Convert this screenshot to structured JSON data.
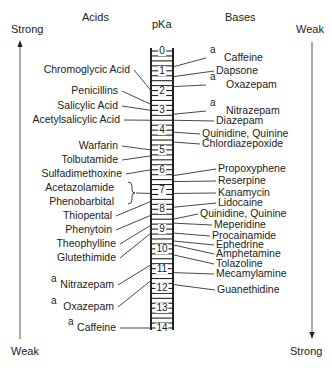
{
  "headers": {
    "acids": "Acids",
    "pka": "pKa",
    "bases": "Bases"
  },
  "left_axis": {
    "top": "Strong",
    "bottom": "Weak"
  },
  "right_axis": {
    "top": "Weak",
    "bottom": "Strong"
  },
  "footnote_marker": "a",
  "scale": {
    "min": 0,
    "max": 14,
    "ticks": [
      "0",
      "1",
      "2",
      "3",
      "4",
      "5",
      "6",
      "7",
      "8",
      "9",
      "10",
      "11",
      "12",
      "13",
      "14"
    ]
  },
  "acids": [
    {
      "name": "Chromoglycic Acid",
      "pka": 2.0
    },
    {
      "name": "Penicillins",
      "pka": 2.7
    },
    {
      "name": "Salicylic Acid",
      "pka": 3.0
    },
    {
      "name": "Acetylsalicylic Acid",
      "pka": 3.5
    },
    {
      "name": "Warfarin",
      "pka": 5.0
    },
    {
      "name": "Tolbutamide",
      "pka": 5.3
    },
    {
      "name": "Sulfadimethoxine",
      "pka": 6.0
    },
    {
      "name": "Acetazolamide",
      "pka": 7.2
    },
    {
      "name": "Phenobarbital",
      "pka": 7.2
    },
    {
      "name": "Thiopental",
      "pka": 7.6
    },
    {
      "name": "Phenytoin",
      "pka": 8.3
    },
    {
      "name": "Theophylline",
      "pka": 8.8
    },
    {
      "name": "Glutethimide",
      "pka": 9.2
    },
    {
      "name": "Nitrazepam",
      "pka": 10.8,
      "footnote": "a"
    },
    {
      "name": "Oxazepam",
      "pka": 11.6,
      "footnote": "a"
    },
    {
      "name": "Caffeine",
      "pka": 14.0,
      "footnote": "a"
    }
  ],
  "bases": [
    {
      "name": "Caffeine",
      "pka": 0.8,
      "footnote": "a"
    },
    {
      "name": "Dapsone",
      "pka": 1.3
    },
    {
      "name": "Oxazepam",
      "pka": 1.8,
      "footnote": "a"
    },
    {
      "name": "Nitrazepam",
      "pka": 3.2,
      "footnote": "a"
    },
    {
      "name": "Diazepam",
      "pka": 3.5
    },
    {
      "name": "Quinidine, Quinine",
      "pka": 4.1
    },
    {
      "name": "Chlordiazepoxide",
      "pka": 4.6
    },
    {
      "name": "Propoxyphene",
      "pka": 6.3
    },
    {
      "name": "Reserpine",
      "pka": 6.6
    },
    {
      "name": "Kanamycin",
      "pka": 7.2
    },
    {
      "name": "Lidocaine",
      "pka": 7.9
    },
    {
      "name": "Quinidine, Quinine",
      "pka": 8.5
    },
    {
      "name": "Meperidine",
      "pka": 8.7
    },
    {
      "name": "Procainamide",
      "pka": 9.2
    },
    {
      "name": "Ephedrine",
      "pka": 9.6
    },
    {
      "name": "Amphetamine",
      "pka": 9.8
    },
    {
      "name": "Tolazoline",
      "pka": 10.3
    },
    {
      "name": "Mecamylamine",
      "pka": 11.2
    },
    {
      "name": "Guanethidine",
      "pka": 11.8
    }
  ]
}
